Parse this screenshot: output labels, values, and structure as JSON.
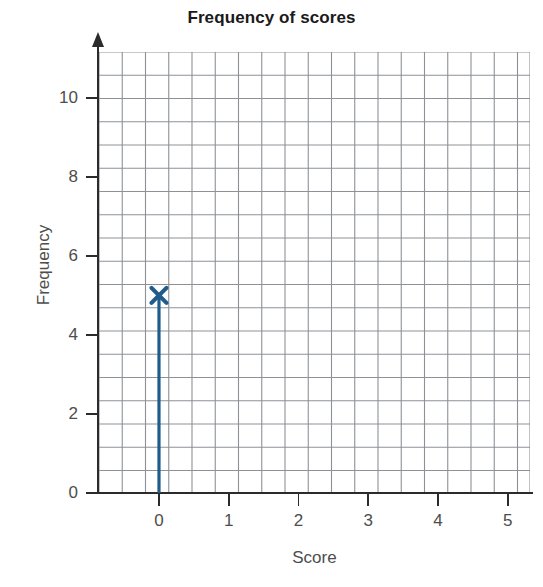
{
  "chart_data": {
    "type": "scatter",
    "title": "Frequency of scores",
    "xlabel": "Score",
    "ylabel": "Frequency",
    "x": [
      0
    ],
    "values": [
      5
    ],
    "categories": [
      "0"
    ],
    "series": [
      {
        "name": "Frequency",
        "marker": "x-cross",
        "color": "#1f5c8b",
        "points": [
          {
            "x": 0,
            "y": 5,
            "stem": true
          }
        ]
      }
    ],
    "xlim": [
      -0.6,
      5.7
    ],
    "ylim": [
      0,
      11.2
    ],
    "xticks": [
      0,
      1,
      2,
      3,
      4,
      5
    ],
    "xtick_labels": [
      "0",
      "1",
      "2",
      "3",
      "4",
      "5"
    ],
    "yticks": [
      0,
      2,
      4,
      6,
      8,
      10
    ],
    "ytick_labels": [
      "0",
      "2",
      "4",
      "6",
      "8",
      "10"
    ],
    "grid": true,
    "grid_type": "minor-squares",
    "grid_color": "#8d9196",
    "legend": false,
    "axis_color": "#2b2b2b",
    "arrow_on_y_axis": true
  },
  "colors": {
    "series": "#1f5c8b",
    "grid": "#8d9196",
    "axis": "#2b2b2b",
    "title_text": "#1a1a1a",
    "label_text": "#4d4d4d",
    "background": "#ffffff"
  }
}
